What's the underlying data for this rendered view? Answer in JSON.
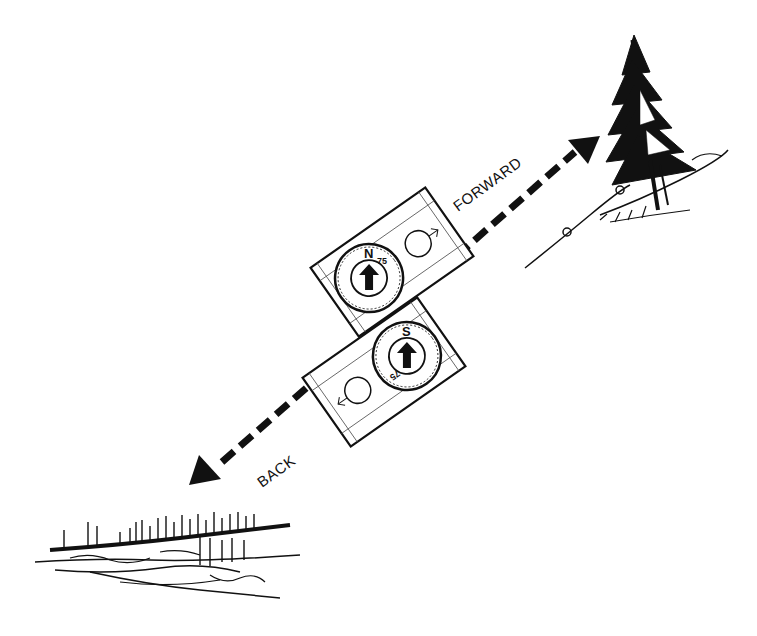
{
  "diagram": {
    "labels": {
      "forward": "FORWARD",
      "back": "BACK"
    },
    "compass_forward": {
      "cardinal": "N",
      "degree_mark": "75"
    },
    "compass_back": {
      "cardinal": "S",
      "degree_mark": "75"
    },
    "landmarks": {
      "forward": "tree",
      "back": "marsh-grass"
    },
    "colors": {
      "ink": "#111111",
      "paper": "#ffffff"
    }
  }
}
